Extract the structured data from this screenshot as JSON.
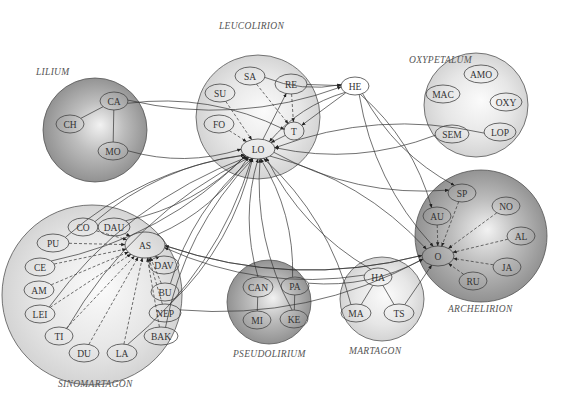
{
  "groups": [
    {
      "id": "lilium",
      "label": "LILIUM",
      "shade": "dark"
    },
    {
      "id": "leucolirion",
      "label": "LEUCOLIRION",
      "shade": "light"
    },
    {
      "id": "oxypetalum",
      "label": "OXYPETALUM",
      "shade": "light"
    },
    {
      "id": "archelirion",
      "label": "ARCHELIRION",
      "shade": "dark"
    },
    {
      "id": "sinomartagon",
      "label": "SINOMARTAGON",
      "shade": "light"
    },
    {
      "id": "pseudolirium",
      "label": "PSEUDOLIRIUM",
      "shade": "dark"
    },
    {
      "id": "martagon",
      "label": "MARTAGON",
      "shade": "light"
    }
  ],
  "nodes": [
    {
      "id": "CA",
      "label": "CA",
      "group": "lilium"
    },
    {
      "id": "CH",
      "label": "CH",
      "group": "lilium"
    },
    {
      "id": "MO",
      "label": "MO",
      "group": "lilium"
    },
    {
      "id": "SA",
      "label": "SA",
      "group": "leucolirion"
    },
    {
      "id": "SU",
      "label": "SU",
      "group": "leucolirion"
    },
    {
      "id": "RE",
      "label": "RE",
      "group": "leucolirion"
    },
    {
      "id": "FO",
      "label": "FO",
      "group": "leucolirion"
    },
    {
      "id": "T",
      "label": "T",
      "group": "leucolirion"
    },
    {
      "id": "LO",
      "label": "LO",
      "group": "leucolirion"
    },
    {
      "id": "HE",
      "label": "HE",
      "group": "none"
    },
    {
      "id": "AMO",
      "label": "AMO",
      "group": "oxypetalum"
    },
    {
      "id": "MAC",
      "label": "MAC",
      "group": "oxypetalum"
    },
    {
      "id": "OXY",
      "label": "OXY",
      "group": "oxypetalum"
    },
    {
      "id": "SEM",
      "label": "SEM",
      "group": "oxypetalum"
    },
    {
      "id": "LOP",
      "label": "LOP",
      "group": "oxypetalum"
    },
    {
      "id": "SP",
      "label": "SP",
      "group": "archelirion"
    },
    {
      "id": "NO",
      "label": "NO",
      "group": "archelirion"
    },
    {
      "id": "AU",
      "label": "AU",
      "group": "archelirion"
    },
    {
      "id": "AL",
      "label": "AL",
      "group": "archelirion"
    },
    {
      "id": "O",
      "label": "O",
      "group": "archelirion"
    },
    {
      "id": "JA",
      "label": "JA",
      "group": "archelirion"
    },
    {
      "id": "RU",
      "label": "RU",
      "group": "archelirion"
    },
    {
      "id": "CO",
      "label": "CO",
      "group": "sinomartagon"
    },
    {
      "id": "DAU",
      "label": "DAU",
      "group": "sinomartagon"
    },
    {
      "id": "PU",
      "label": "PU",
      "group": "sinomartagon"
    },
    {
      "id": "AS",
      "label": "AS",
      "group": "sinomartagon"
    },
    {
      "id": "CE",
      "label": "CE",
      "group": "sinomartagon"
    },
    {
      "id": "DAV",
      "label": "DAV",
      "group": "sinomartagon"
    },
    {
      "id": "AM",
      "label": "AM",
      "group": "sinomartagon"
    },
    {
      "id": "BU",
      "label": "BU",
      "group": "sinomartagon"
    },
    {
      "id": "LEI",
      "label": "LEI",
      "group": "sinomartagon"
    },
    {
      "id": "NEP",
      "label": "NEP",
      "group": "sinomartagon"
    },
    {
      "id": "TI",
      "label": "TI",
      "group": "sinomartagon"
    },
    {
      "id": "BAK",
      "label": "BAK",
      "group": "sinomartagon"
    },
    {
      "id": "DU",
      "label": "DU",
      "group": "sinomartagon"
    },
    {
      "id": "LA",
      "label": "LA",
      "group": "sinomartagon"
    },
    {
      "id": "CAN",
      "label": "CAN",
      "group": "pseudolirium"
    },
    {
      "id": "PA",
      "label": "PA",
      "group": "pseudolirium"
    },
    {
      "id": "MI",
      "label": "MI",
      "group": "pseudolirium"
    },
    {
      "id": "KE",
      "label": "KE",
      "group": "pseudolirium"
    },
    {
      "id": "HA",
      "label": "HA",
      "group": "martagon"
    },
    {
      "id": "MA",
      "label": "MA",
      "group": "martagon"
    },
    {
      "id": "TS",
      "label": "TS",
      "group": "martagon"
    }
  ],
  "edges": [
    {
      "from": "CA",
      "to": "CH",
      "style": "solid",
      "arrow": false
    },
    {
      "from": "CA",
      "to": "MO",
      "style": "solid",
      "arrow": false
    },
    {
      "from": "CA",
      "to": "HE",
      "style": "solid",
      "arrow": true
    },
    {
      "from": "CA",
      "to": "T",
      "style": "solid",
      "arrow": true
    },
    {
      "from": "MO",
      "to": "LO",
      "style": "solid",
      "arrow": true
    },
    {
      "from": "SA",
      "to": "T",
      "style": "dashed",
      "arrow": true
    },
    {
      "from": "SA",
      "to": "HE",
      "style": "solid",
      "arrow": true
    },
    {
      "from": "SU",
      "to": "LO",
      "style": "dashed",
      "arrow": true
    },
    {
      "from": "FO",
      "to": "LO",
      "style": "dashed",
      "arrow": true
    },
    {
      "from": "RE",
      "to": "T",
      "style": "dashed",
      "arrow": true
    },
    {
      "from": "RE",
      "to": "HE",
      "style": "solid",
      "arrow": true
    },
    {
      "from": "T",
      "to": "LO",
      "style": "solid",
      "arrow": true
    },
    {
      "from": "HE",
      "to": "LO",
      "style": "solid",
      "arrow": true
    },
    {
      "from": "HE",
      "to": "T",
      "style": "solid",
      "arrow": true
    },
    {
      "from": "HE",
      "to": "SP",
      "style": "solid",
      "arrow": true
    },
    {
      "from": "HE",
      "to": "AU",
      "style": "solid",
      "arrow": true
    },
    {
      "from": "HE",
      "to": "O",
      "style": "solid",
      "arrow": true
    },
    {
      "from": "SEM",
      "to": "LO",
      "style": "solid",
      "arrow": true
    },
    {
      "from": "LOP",
      "to": "LO",
      "style": "solid",
      "arrow": true
    },
    {
      "from": "LO",
      "to": "RE",
      "style": "solid",
      "arrow": true
    },
    {
      "from": "LO",
      "to": "SP",
      "style": "solid",
      "arrow": true
    },
    {
      "from": "LO",
      "to": "O",
      "style": "solid",
      "arrow": true
    },
    {
      "from": "SP",
      "to": "O",
      "style": "dashed",
      "arrow": true
    },
    {
      "from": "NO",
      "to": "O",
      "style": "dashed",
      "arrow": true
    },
    {
      "from": "AU",
      "to": "O",
      "style": "dashed",
      "arrow": true
    },
    {
      "from": "AL",
      "to": "O",
      "style": "dashed",
      "arrow": true
    },
    {
      "from": "JA",
      "to": "O",
      "style": "dashed",
      "arrow": true
    },
    {
      "from": "RU",
      "to": "O",
      "style": "dashed",
      "arrow": true
    },
    {
      "from": "CO",
      "to": "AS",
      "style": "dashed",
      "arrow": true
    },
    {
      "from": "DAU",
      "to": "AS",
      "style": "solid",
      "arrow": true
    },
    {
      "from": "PU",
      "to": "AS",
      "style": "dashed",
      "arrow": true
    },
    {
      "from": "CE",
      "to": "AS",
      "style": "dashed",
      "arrow": true
    },
    {
      "from": "AM",
      "to": "AS",
      "style": "dashed",
      "arrow": true
    },
    {
      "from": "LEI",
      "to": "AS",
      "style": "dashed",
      "arrow": true
    },
    {
      "from": "TI",
      "to": "AS",
      "style": "dashed",
      "arrow": true
    },
    {
      "from": "DU",
      "to": "AS",
      "style": "dashed",
      "arrow": true
    },
    {
      "from": "LA",
      "to": "AS",
      "style": "dashed",
      "arrow": true
    },
    {
      "from": "BAK",
      "to": "AS",
      "style": "dashed",
      "arrow": true
    },
    {
      "from": "NEP",
      "to": "AS",
      "style": "dashed",
      "arrow": true
    },
    {
      "from": "BU",
      "to": "AS",
      "style": "dashed",
      "arrow": true
    },
    {
      "from": "DAV",
      "to": "AS",
      "style": "dashed",
      "arrow": true
    },
    {
      "from": "CO",
      "to": "LO",
      "style": "solid",
      "arrow": true
    },
    {
      "from": "DAU",
      "to": "LO",
      "style": "solid",
      "arrow": true
    },
    {
      "from": "PU",
      "to": "LO",
      "style": "solid",
      "arrow": true
    },
    {
      "from": "CE",
      "to": "LO",
      "style": "solid",
      "arrow": true
    },
    {
      "from": "LEI",
      "to": "LO",
      "style": "solid",
      "arrow": true
    },
    {
      "from": "AS",
      "to": "LO",
      "style": "solid",
      "arrow": true
    },
    {
      "from": "BU",
      "to": "LO",
      "style": "solid",
      "arrow": true
    },
    {
      "from": "NEP",
      "to": "LO",
      "style": "solid",
      "arrow": true
    },
    {
      "from": "BAK",
      "to": "LO",
      "style": "solid",
      "arrow": true
    },
    {
      "from": "LA",
      "to": "LO",
      "style": "solid",
      "arrow": true
    },
    {
      "from": "TI",
      "to": "LO",
      "style": "solid",
      "arrow": true
    },
    {
      "from": "AS",
      "to": "O",
      "style": "solid",
      "arrow": true
    },
    {
      "from": "O",
      "to": "AS",
      "style": "solid",
      "arrow": true
    },
    {
      "from": "NEP",
      "to": "O",
      "style": "solid",
      "arrow": true
    },
    {
      "from": "CAN",
      "to": "MI",
      "style": "solid",
      "arrow": false
    },
    {
      "from": "PA",
      "to": "KE",
      "style": "solid",
      "arrow": false
    },
    {
      "from": "CAN",
      "to": "LO",
      "style": "solid",
      "arrow": true
    },
    {
      "from": "PA",
      "to": "LO",
      "style": "solid",
      "arrow": true
    },
    {
      "from": "KE",
      "to": "LO",
      "style": "solid",
      "arrow": true
    },
    {
      "from": "PA",
      "to": "O",
      "style": "solid",
      "arrow": true
    },
    {
      "from": "HA",
      "to": "MA",
      "style": "solid",
      "arrow": false
    },
    {
      "from": "HA",
      "to": "TS",
      "style": "solid",
      "arrow": false
    },
    {
      "from": "HA",
      "to": "LO",
      "style": "solid",
      "arrow": true
    },
    {
      "from": "MA",
      "to": "LO",
      "style": "solid",
      "arrow": true
    },
    {
      "from": "HA",
      "to": "AS",
      "style": "solid",
      "arrow": true
    },
    {
      "from": "TS",
      "to": "O",
      "style": "solid",
      "arrow": true
    }
  ]
}
